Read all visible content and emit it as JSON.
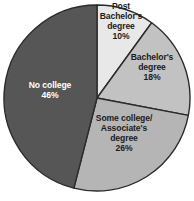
{
  "chart_data": {
    "type": "pie",
    "title": "",
    "subtitle": "",
    "xlabel": "",
    "ylabel": "",
    "legend_position": "none",
    "grid": false,
    "background_color": "#ffffff",
    "outline_color": "#2b2b2b",
    "start_angle_deg": 0,
    "direction": "clockwise",
    "categories": [
      "Post Bachelor's degree",
      "Bachelor's degree",
      "Some college/Associate's degree",
      "No college"
    ],
    "values": [
      10,
      18,
      26,
      46
    ],
    "unit": "%",
    "slices": [
      {
        "id": "post-bachelors",
        "lines": [
          "Post",
          "Bachelor's",
          "degree"
        ],
        "percent_label": "10%",
        "value": 10,
        "color": "#e8e8e8",
        "text_color": "#1c1c1c",
        "text_style": "dark",
        "label_x": 121,
        "label_y": 22
      },
      {
        "id": "bachelors",
        "lines": [
          "Bachelor's",
          "degree"
        ],
        "percent_label": "18%",
        "value": 18,
        "color": "#c2c2c2",
        "text_color": "#1c1c1c",
        "text_style": "dark",
        "label_x": 152,
        "label_y": 68
      },
      {
        "id": "some-college",
        "lines": [
          "Some college/",
          "Associate's",
          "degree"
        ],
        "percent_label": "26%",
        "value": 26,
        "color": "#b5b5b5",
        "text_color": "#1c1c1c",
        "text_style": "dark",
        "label_x": 124,
        "label_y": 134
      },
      {
        "id": "no-college",
        "lines": [
          "No college"
        ],
        "percent_label": "46%",
        "value": 46,
        "color": "#565656",
        "text_color": "#ffffff",
        "text_style": "light",
        "label_x": 50,
        "label_y": 91
      }
    ],
    "geometry": {
      "center_x": 97,
      "center_y": 98,
      "radius": 93
    }
  }
}
